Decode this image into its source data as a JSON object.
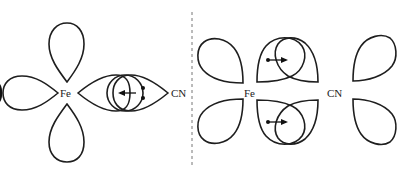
{
  "diagram": {
    "type": "orbital-overlap-illustration",
    "left_panel": {
      "description": "sigma donation: CN lone pair into Fe d-orbital",
      "metal_label": "Fe",
      "ligand_label": "CN"
    },
    "right_panel": {
      "description": "pi back-donation: Fe d-orbital into CN pi* orbital",
      "metal_label": "Fe",
      "ligand_label": "CN"
    },
    "colors": {
      "stroke": "#1e1e1e",
      "divider": "#777777",
      "background": "#ffffff"
    }
  }
}
